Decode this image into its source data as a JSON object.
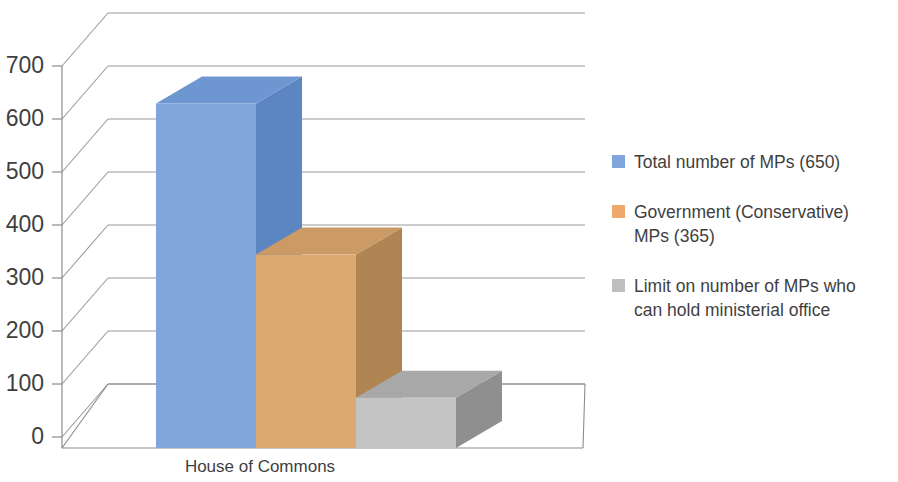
{
  "chart_data": {
    "type": "bar",
    "subtype": "3d-clustered-column",
    "title": "",
    "xlabel": "",
    "ylabel": "",
    "categories": [
      "House of Commons"
    ],
    "ylim": [
      0,
      700
    ],
    "ytick_step": 100,
    "yticks": [
      "0",
      "100",
      "200",
      "300",
      "400",
      "500",
      "600",
      "700"
    ],
    "grid": true,
    "legend_position": "right",
    "series": [
      {
        "name": "Total number of MPs (650)",
        "values": [
          650
        ],
        "color": "#7fa5db",
        "side_color": "#5b86c2",
        "top_color": "#6e97d1"
      },
      {
        "name": "Government (Conservative)\nMPs (365)",
        "values": [
          365
        ],
        "color": "#dba971",
        "side_color": "#b08453",
        "top_color": "#cb9a65"
      },
      {
        "name": "Limit on number of MPs who\ncan hold ministerial office",
        "values": [
          95
        ],
        "color": "#c4c4c4",
        "side_color": "#8f8f8f",
        "top_color": "#a8a8a8"
      }
    ]
  },
  "axis": {
    "y_tick_labels": [
      "700",
      "600",
      "500",
      "400",
      "300",
      "200",
      "100",
      "0"
    ],
    "category_label": "House of Commons"
  },
  "legend": {
    "items": [
      {
        "label": "Total number of MPs (650)",
        "color": "#7fa5db"
      },
      {
        "label": "Government (Conservative)\nMPs (365)",
        "color": "#eda96b"
      },
      {
        "label": "Limit on number of MPs who\ncan hold ministerial office",
        "color": "#bfbfbf"
      }
    ]
  },
  "colors": {
    "grid": "#9a9a9a",
    "axis": "#8c8c8c",
    "text": "#3f3f3f",
    "background": "#ffffff"
  }
}
